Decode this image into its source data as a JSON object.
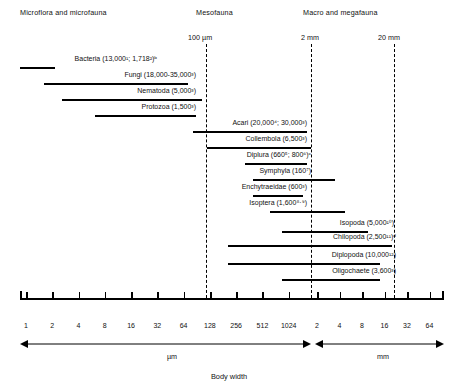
{
  "chart_data": {
    "type": "bar",
    "title": "",
    "xlabel": "Body width",
    "ylabel": "",
    "orientation": "horizontal-range",
    "scale": "log2",
    "grid": false,
    "legend": false,
    "axis": {
      "um_ticks": [
        "1",
        "2",
        "4",
        "8",
        "16",
        "32",
        "64",
        "128",
        "256",
        "512",
        "1024"
      ],
      "mm_ticks": [
        "2",
        "4",
        "8",
        "16",
        "32",
        "64"
      ],
      "um_unit": "µm",
      "mm_unit": "mm",
      "title": "Body width"
    },
    "reference_lines": [
      {
        "label": "100 µm",
        "value_um": 100
      },
      {
        "label": "2 mm",
        "value_mm": 2
      },
      {
        "label": "20 mm",
        "value_mm": 20
      }
    ],
    "groups": [
      {
        "name": "Microflora and microfauna"
      },
      {
        "name": "Mesofauna"
      },
      {
        "name": "Macro and megafauna"
      }
    ],
    "categories": [
      "Bacteria",
      "Fungi",
      "Nematoda",
      "Protozoa",
      "Acari",
      "Collembola",
      "Diplura",
      "Symphyla",
      "Enchytraeidae",
      "Isoptera",
      "Isopoda",
      "Chilopoda",
      "Diplopoda",
      "Oligochaete"
    ],
    "series": [
      {
        "name": "Body width range",
        "bars": [
          {
            "taxon": "Bacteria",
            "x_start_um": 1,
            "x_end_um": 2.4
          },
          {
            "taxon": "Fungi",
            "x_start_um": 2.5,
            "x_end_um": 300
          },
          {
            "taxon": "Nematoda",
            "x_start_um": 6,
            "x_end_um": 600
          },
          {
            "taxon": "Protozoa",
            "x_start_um": 16,
            "x_end_um": 490
          },
          {
            "taxon": "Acari",
            "x_start_um": 56,
            "x_end_um": 2000
          },
          {
            "taxon": "Collembola",
            "x_start_um": 110,
            "x_end_um": 2200
          },
          {
            "taxon": "Diplura",
            "x_start_um": 330,
            "x_end_um": 2000
          },
          {
            "taxon": "Symphyla",
            "x_start_um": 440,
            "x_end_um": 3800
          },
          {
            "taxon": "Enchytraeidae",
            "x_start_um": 440,
            "x_end_um": 1900
          },
          {
            "taxon": "Isoptera",
            "x_start_um": 700,
            "x_end_um": 5000
          },
          {
            "taxon": "Isopoda",
            "x_start_um": 1000,
            "x_end_um": 8000
          },
          {
            "taxon": "Chilopoda",
            "x_start_um": 280,
            "x_end_um": 12000
          },
          {
            "taxon": "Diplopoda",
            "x_start_um": 280,
            "x_end_um": 9000
          },
          {
            "taxon": "Oligochaete",
            "x_start_um": 1000,
            "x_end_um": 9000
          }
        ]
      }
    ]
  },
  "headers": [
    {
      "text": "Microflora and microfauna"
    },
    {
      "text": "Mesofauna"
    },
    {
      "text": "Macro and megafauna"
    }
  ],
  "reference_labels": [
    {
      "text": "100 µm"
    },
    {
      "text": "2 mm"
    },
    {
      "text": "20 mm"
    }
  ],
  "taxa": [
    {
      "name": "Bacteria",
      "counts": "13,000",
      "label_html": "Bacteria (13,000"
    },
    {
      "name": "Fungi",
      "counts": "18,000-35,000"
    },
    {
      "name": "Nematoda",
      "counts": "5,000"
    },
    {
      "name": "Protozoa",
      "counts": "1,500"
    },
    {
      "name": "Acari",
      "counts": "20,000; 30,000"
    },
    {
      "name": "Collembola",
      "counts": "6,500"
    },
    {
      "name": "Diplura",
      "counts": "660; 800"
    },
    {
      "name": "Symphyla",
      "counts": "160"
    },
    {
      "name": "Enchytraeidae",
      "counts": "600"
    },
    {
      "name": "Isoptera",
      "counts": "1,600"
    },
    {
      "name": "Isopoda",
      "counts": "5,000"
    },
    {
      "name": "Chilopoda",
      "counts": "2,500"
    },
    {
      "name": "Diplopoda",
      "counts": "10,000"
    },
    {
      "name": "Oligochaete",
      "counts": "3,600"
    }
  ],
  "taxon_labels": {
    "bacteria": "Bacteria (13,000¹; 1,718²)ᵇ",
    "fungi": "Fungi (18,000-35,000³)",
    "nematoda": "Nematoda (5,000³)",
    "protozoa": "Protozoa (1,500³)",
    "acari": "Acari (20,000⁴; 30,000³)",
    "collembola": "Collembola (6,500³)",
    "diplura": "Diplura (660⁵; 800⁶)ᶜ",
    "symphyla": "Symphyla (160⁷)",
    "enchytraeidae": "Enchytraeidae (600³)",
    "isoptera": "Isoptera (1,600⁸·⁹)",
    "isopoda": "Isopoda (5,000¹⁰)",
    "chilopoda": "Chilopoda (2,500¹¹)ᵈ",
    "diplopoda": "Diplopoda (10,000¹²)",
    "oligochaete": "Oligochaete (3,600³)"
  },
  "ticks_um": [
    {
      "label": "1"
    },
    {
      "label": "2"
    },
    {
      "label": "4"
    },
    {
      "label": "8"
    },
    {
      "label": "16"
    },
    {
      "label": "32"
    },
    {
      "label": "64"
    },
    {
      "label": "128"
    },
    {
      "label": "256"
    },
    {
      "label": "512"
    },
    {
      "label": "1024"
    }
  ],
  "ticks_mm": [
    {
      "label": "2"
    },
    {
      "label": "4"
    },
    {
      "label": "8"
    },
    {
      "label": "16"
    },
    {
      "label": "32"
    },
    {
      "label": "64"
    }
  ],
  "units": {
    "um": "µm",
    "mm": "mm"
  },
  "axis_title": "Body width"
}
